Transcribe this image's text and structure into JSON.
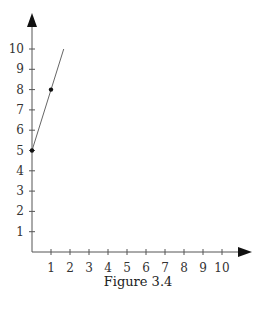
{
  "chart_data": {
    "type": "line",
    "title": "",
    "caption": "Figure 3.4",
    "xlabel": "",
    "ylabel": "",
    "x_ticks": [
      1,
      2,
      3,
      4,
      5,
      6,
      7,
      8,
      9,
      10
    ],
    "y_ticks": [
      1,
      2,
      3,
      4,
      5,
      6,
      7,
      8,
      9,
      10
    ],
    "xlim": [
      0,
      11
    ],
    "ylim": [
      0,
      11
    ],
    "grid": false,
    "legend": null,
    "series": [
      {
        "name": "line",
        "line_from": {
          "x": 0,
          "y": 5
        },
        "line_to": {
          "x": 1.67,
          "y": 10
        },
        "points": [
          {
            "x": 0,
            "y": 5
          },
          {
            "x": 1,
            "y": 8
          }
        ]
      }
    ]
  },
  "figure": {
    "caption": "Figure 3.4"
  }
}
